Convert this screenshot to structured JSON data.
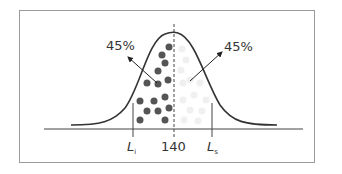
{
  "diagram": {
    "type": "normal-distribution",
    "center_label": "140",
    "lower_limit_label": "L",
    "lower_limit_sub": "i",
    "upper_limit_label": "L",
    "upper_limit_sub": "s",
    "left_percent": "45%",
    "right_percent": "45%",
    "colors": {
      "dark_dots": "#555555",
      "light_dots": "#f2f2f2",
      "curve": "#333333"
    }
  }
}
